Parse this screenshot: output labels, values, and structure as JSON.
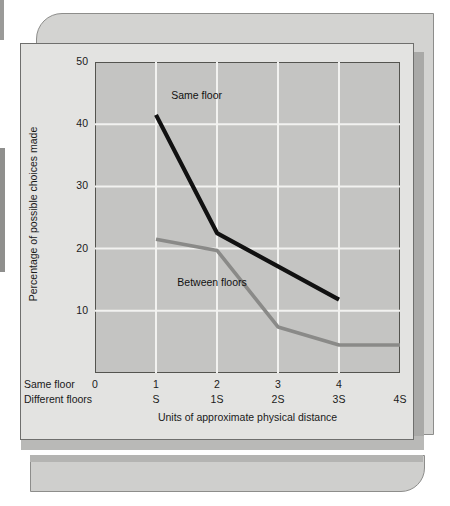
{
  "chart_data": {
    "type": "line",
    "title": "",
    "xlabel": "Units of approximate physical distance",
    "ylabel": "Percentage of possible choices made",
    "ylim": [
      0,
      50
    ],
    "yticks": [
      10,
      20,
      30,
      40,
      50
    ],
    "grid": true,
    "legend_position": "inline-annotation",
    "x_axis_rows": [
      {
        "row_label": "Same floor",
        "ticks": [
          "0",
          "1",
          "2",
          "3",
          "4",
          ""
        ]
      },
      {
        "row_label": "Different floors",
        "ticks": [
          "",
          "S",
          "1S",
          "2S",
          "3S",
          "4S"
        ]
      }
    ],
    "x_positions": [
      0,
      1,
      2,
      3,
      4,
      5
    ],
    "series": [
      {
        "name": "Same floor",
        "color": "#111111",
        "points": [
          {
            "x": 1,
            "y": 41.5
          },
          {
            "x": 2,
            "y": 22.5
          },
          {
            "x": 4,
            "y": 11.8
          }
        ]
      },
      {
        "name": "Between floors",
        "color": "#8a8a88",
        "points": [
          {
            "x": 1,
            "y": 21.5
          },
          {
            "x": 2,
            "y": 19.7
          },
          {
            "x": 3,
            "y": 7.4
          },
          {
            "x": 4,
            "y": 4.5
          },
          {
            "x": 5,
            "y": 4.5
          }
        ]
      }
    ],
    "annotations": [
      {
        "text": "Same floor",
        "x": 1.25,
        "y": 44.5
      },
      {
        "text": "Between floors",
        "x": 1.35,
        "y": 14.5
      }
    ]
  },
  "colors": {
    "plot_background": "#c4c4c2",
    "gridline": "#f2f2f0",
    "axis": "#54544f",
    "card_front": "#e3e3e1",
    "card_back": "#d3d3d1",
    "series_same_floor": "#111111",
    "series_between_floors": "#8a8a88"
  }
}
